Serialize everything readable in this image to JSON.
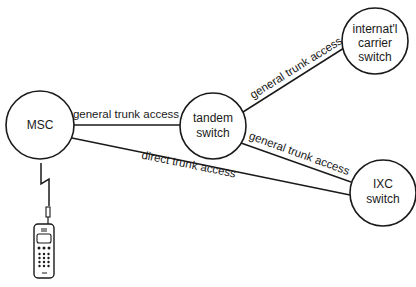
{
  "diagram": {
    "type": "network",
    "nodes": [
      {
        "id": "msc",
        "label_lines": [
          "MSC"
        ]
      },
      {
        "id": "tandem",
        "label_lines": [
          "tandem",
          "switch"
        ]
      },
      {
        "id": "intl",
        "label_lines": [
          "internat'l",
          "carrier",
          "switch"
        ]
      },
      {
        "id": "ixc",
        "label_lines": [
          "IXC",
          "switch"
        ]
      }
    ],
    "edges": [
      {
        "from": "msc",
        "to": "tandem",
        "label": "general trunk access"
      },
      {
        "from": "tandem",
        "to": "intl",
        "label": "general trunk access"
      },
      {
        "from": "tandem",
        "to": "ixc",
        "label": "general trunk access"
      },
      {
        "from": "msc",
        "to": "ixc",
        "label": "direct trunk access"
      }
    ],
    "devices": [
      {
        "id": "mobile-phone",
        "connection": "wireless-link",
        "connected_to": "msc"
      }
    ]
  }
}
